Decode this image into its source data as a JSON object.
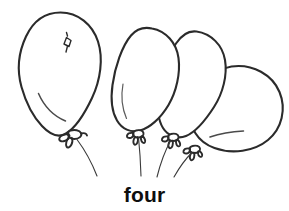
{
  "page": {
    "title": "four",
    "background_color": "#ffffff",
    "ink_color": "#2b2b2b",
    "caption_color": "#0e0e0e"
  },
  "caption": {
    "text": "four"
  },
  "illustration": {
    "subject": "balloons",
    "count_label": "four",
    "count_value": 4,
    "style": "black-and-white line drawing",
    "balloons": [
      {
        "name": "balloon-1",
        "position": "far-left",
        "orientation": "upright",
        "has_highlight_mark": true,
        "has_shade_stroke": true,
        "has_knot": true,
        "has_string": true
      },
      {
        "name": "balloon-2",
        "position": "center-left",
        "orientation": "upright",
        "has_highlight_mark": false,
        "has_shade_stroke": true,
        "has_knot": true,
        "has_string": true
      },
      {
        "name": "balloon-3",
        "position": "center-right",
        "orientation": "upright",
        "has_highlight_mark": false,
        "has_shade_stroke": false,
        "has_knot": true,
        "has_string": true
      },
      {
        "name": "balloon-4",
        "position": "far-right",
        "orientation": "tilted-right",
        "has_highlight_mark": false,
        "has_shade_stroke": true,
        "has_knot": true,
        "has_string": true
      }
    ]
  }
}
